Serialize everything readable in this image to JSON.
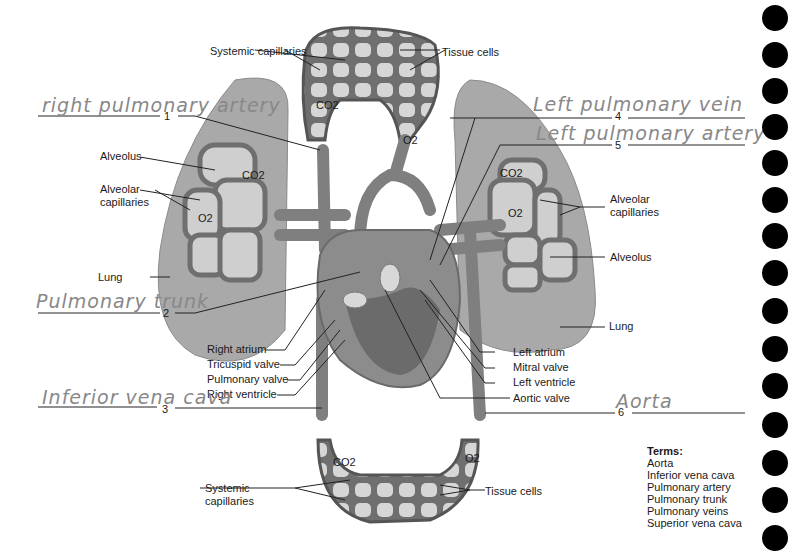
{
  "diagram": {
    "printed_labels": {
      "systemic_capillaries_top": "Systemic capillaries",
      "tissue_cells_top": "Tissue cells",
      "co2_top": "CO2",
      "o2_top": "O2",
      "alveolus_left": "Alveolus",
      "alveolar_capillaries_left": "Alveolar capillaries",
      "co2_left": "CO2",
      "o2_left": "O2",
      "lung_left": "Lung",
      "right_atrium": "Right atrium",
      "tricuspid_valve": "Tricuspid valve",
      "pulmonary_valve": "Pulmonary valve",
      "right_ventricle": "Right ventricle",
      "left_atrium": "Left atrium",
      "mitral_valve": "Mitral valve",
      "left_ventricle": "Left ventricle",
      "aortic_valve": "Aortic valve",
      "alveolar_capillaries_right": "Alveolar capillaries",
      "alveolus_right": "Alveolus",
      "co2_right": "CO2",
      "o2_right": "O2",
      "lung_right": "Lung",
      "systemic_capillaries_bottom": "Systemic capillaries",
      "tissue_cells_bottom": "Tissue cells",
      "co2_bottom": "CO2",
      "o2_bottom": "O2"
    },
    "blanks": [
      {
        "number": "1",
        "answer": "right pulmonary artery"
      },
      {
        "number": "2",
        "answer": "Pulmonary trunk"
      },
      {
        "number": "3",
        "answer": "Inferior vena cava"
      },
      {
        "number": "4",
        "answer": "Left pulmonary vein"
      },
      {
        "number": "5",
        "answer": "Left pulmonary artery"
      },
      {
        "number": "6",
        "answer": "Aorta"
      }
    ],
    "terms": {
      "title": "Terms:",
      "items": [
        "Aorta",
        "Inferior vena cava",
        "Pulmonary artery",
        "Pulmonary trunk",
        "Pulmonary veins",
        "Superior vena cava"
      ]
    },
    "colors": {
      "tissue": "#8a8a8a",
      "lung": "#a9a9a9",
      "capillary": "#6f6f6f",
      "cell": "#d8d8d8",
      "handwriting": "#888888"
    }
  }
}
